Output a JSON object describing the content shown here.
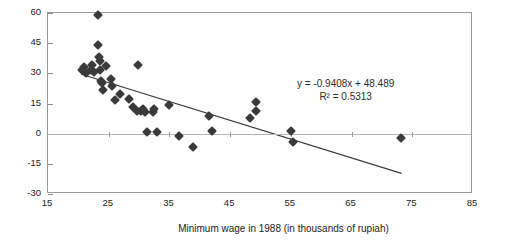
{
  "chart_data": {
    "type": "scatter",
    "title": "",
    "xlabel": "Minimum wage in 1988 (in thousands of rupiah)",
    "ylabel": "",
    "xlim": [
      15,
      85
    ],
    "ylim": [
      -30,
      60
    ],
    "xticks": [
      15,
      25,
      35,
      45,
      55,
      65,
      75,
      85
    ],
    "yticks": [
      60,
      45,
      30,
      15,
      0,
      -15,
      -30
    ],
    "grid": false,
    "legend": "none",
    "annotations": {
      "equation": "y = -0.9408x + 48.489",
      "r_squared": "R² = 0.5313"
    },
    "trendline": {
      "slope": -0.9408,
      "intercept": 48.489,
      "x_start": 20.5,
      "x_end": 73.5
    },
    "points": [
      {
        "x": 20.6,
        "y": 31.5
      },
      {
        "x": 21.0,
        "y": 33.0
      },
      {
        "x": 21.3,
        "y": 30.0
      },
      {
        "x": 22.0,
        "y": 31.5
      },
      {
        "x": 22.3,
        "y": 34.0
      },
      {
        "x": 22.6,
        "y": 30.5
      },
      {
        "x": 23.2,
        "y": 59.0
      },
      {
        "x": 23.3,
        "y": 44.0
      },
      {
        "x": 23.4,
        "y": 38.0
      },
      {
        "x": 23.5,
        "y": 36.0
      },
      {
        "x": 23.6,
        "y": 31.5
      },
      {
        "x": 23.8,
        "y": 26.0
      },
      {
        "x": 23.9,
        "y": 25.0
      },
      {
        "x": 24.0,
        "y": 21.5
      },
      {
        "x": 24.6,
        "y": 33.5
      },
      {
        "x": 25.3,
        "y": 27.0
      },
      {
        "x": 25.6,
        "y": 23.5
      },
      {
        "x": 26.0,
        "y": 16.5
      },
      {
        "x": 26.8,
        "y": 19.5
      },
      {
        "x": 28.3,
        "y": 17.0
      },
      {
        "x": 29.0,
        "y": 13.5
      },
      {
        "x": 29.6,
        "y": 11.5
      },
      {
        "x": 29.8,
        "y": 34.0
      },
      {
        "x": 30.3,
        "y": 11.5
      },
      {
        "x": 30.6,
        "y": 12.5
      },
      {
        "x": 31.0,
        "y": 11.0
      },
      {
        "x": 31.3,
        "y": 1.0
      },
      {
        "x": 32.3,
        "y": 11.0
      },
      {
        "x": 32.4,
        "y": 12.5
      },
      {
        "x": 33.0,
        "y": 1.0
      },
      {
        "x": 35.0,
        "y": 14.5
      },
      {
        "x": 36.5,
        "y": -1.0
      },
      {
        "x": 38.8,
        "y": -6.5
      },
      {
        "x": 41.5,
        "y": 9.0
      },
      {
        "x": 42.0,
        "y": 1.5
      },
      {
        "x": 48.3,
        "y": 8.0
      },
      {
        "x": 49.2,
        "y": 15.5
      },
      {
        "x": 49.3,
        "y": 11.5
      },
      {
        "x": 55.0,
        "y": 1.5
      },
      {
        "x": 55.3,
        "y": -4.0
      },
      {
        "x": 73.2,
        "y": -2.0
      }
    ]
  },
  "axis": {
    "x_tick_labels": [
      "15",
      "25",
      "35",
      "45",
      "55",
      "65",
      "75",
      "85"
    ],
    "y_tick_labels": [
      "60",
      "45",
      "30",
      "15",
      "0",
      "-15",
      "-30"
    ],
    "x_title": "Minimum wage in 1988 (in thousands of rupiah)"
  }
}
